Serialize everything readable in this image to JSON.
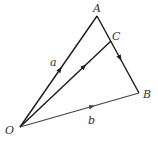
{
  "diagram": {
    "type": "vector-triangle",
    "points": {
      "O": {
        "label": "O",
        "x": 20,
        "y": 127
      },
      "A": {
        "label": "A",
        "x": 97,
        "y": 16
      },
      "B": {
        "label": "B",
        "x": 139,
        "y": 93
      },
      "C": {
        "label": "C",
        "x": 111,
        "y": 41
      }
    },
    "vectors": [
      {
        "from": "O",
        "to": "A",
        "label": "a"
      },
      {
        "from": "O",
        "to": "B",
        "label": "b"
      },
      {
        "from": "O",
        "to": "C",
        "label": ""
      },
      {
        "from": "A",
        "to": "B",
        "label": ""
      }
    ],
    "labels": {
      "point_O": "O",
      "point_A": "A",
      "point_B": "B",
      "point_C": "C",
      "vector_a": "a",
      "vector_b": "b"
    },
    "colors": {
      "line": "#1a1a1a",
      "line_b": "#444444",
      "text": "#333333"
    }
  }
}
